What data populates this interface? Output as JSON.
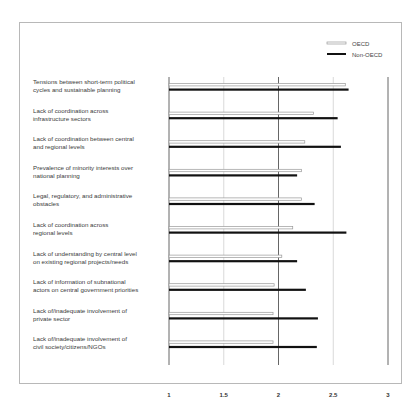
{
  "chart_data": {
    "type": "bar",
    "orientation": "horizontal",
    "title": "",
    "xlabel": "",
    "ylabel": "",
    "xlim": [
      1,
      3
    ],
    "xticks": [
      "1",
      "1.5",
      "2",
      "2.5",
      "3"
    ],
    "grid": true,
    "legend_position": "top-right",
    "categories": [
      [
        "Tensions between short-term political",
        "cycles and sustainable planning"
      ],
      [
        "Lack of coordination across",
        "infrastructure sectors"
      ],
      [
        "Lack of coordination between central",
        "and regional levels"
      ],
      [
        "Prevalence of minority interests over",
        "national planning"
      ],
      [
        "Legal, regulatory, and administrative",
        "obstacles"
      ],
      [
        "Lack of coordination across",
        "regional levels"
      ],
      [
        "Lack of understanding by central level",
        "on existing regional projects/needs"
      ],
      [
        "Lack of information of subnational",
        "actors on central government priorities"
      ],
      [
        "Lack of/inadequate involvement of",
        "private sector"
      ],
      [
        "Lack of/inadequate involvement of",
        "civil society/citizens/NGOs"
      ]
    ],
    "series": [
      {
        "name": "OECD",
        "color": "#aaaaaa",
        "style": "outlined-light",
        "values": [
          2.61,
          2.32,
          2.24,
          2.21,
          2.21,
          2.13,
          2.03,
          1.96,
          1.95,
          1.95
        ]
      },
      {
        "name": "Non-OECD",
        "color": "#111111",
        "style": "solid-dark",
        "values": [
          2.64,
          2.54,
          2.57,
          2.17,
          2.33,
          2.62,
          2.17,
          2.25,
          2.36,
          2.35
        ]
      }
    ]
  }
}
